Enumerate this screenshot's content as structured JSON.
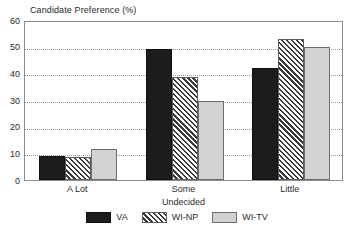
{
  "chart_data": {
    "type": "bar",
    "title": "Candidate Preference (%)",
    "xlabel": "Undecided",
    "ylabel": "",
    "categories": [
      "A Lot",
      "Some",
      "Little"
    ],
    "series": [
      {
        "name": "VA",
        "values": [
          9,
          49,
          42
        ],
        "fill": "#1c1c1c",
        "pattern": "solid"
      },
      {
        "name": "WI-NP",
        "values": [
          8.5,
          38.5,
          53
        ],
        "fill": "#ffffff",
        "pattern": "diagonal-hatch"
      },
      {
        "name": "WI-TV",
        "values": [
          11.5,
          29.7,
          50
        ],
        "fill": "#d2d2d2",
        "pattern": "solid"
      }
    ],
    "ylim": [
      0,
      60
    ],
    "yticks": [
      "0",
      "10",
      "20",
      "30",
      "40",
      "50",
      "60"
    ],
    "ytick_values": [
      0,
      10,
      20,
      30,
      40,
      50,
      60
    ],
    "grid": true,
    "grid_style": "dotted-horizontal",
    "legend_position": "bottom-center",
    "legend": [
      "VA",
      "WI-NP",
      "WI-TV"
    ]
  }
}
